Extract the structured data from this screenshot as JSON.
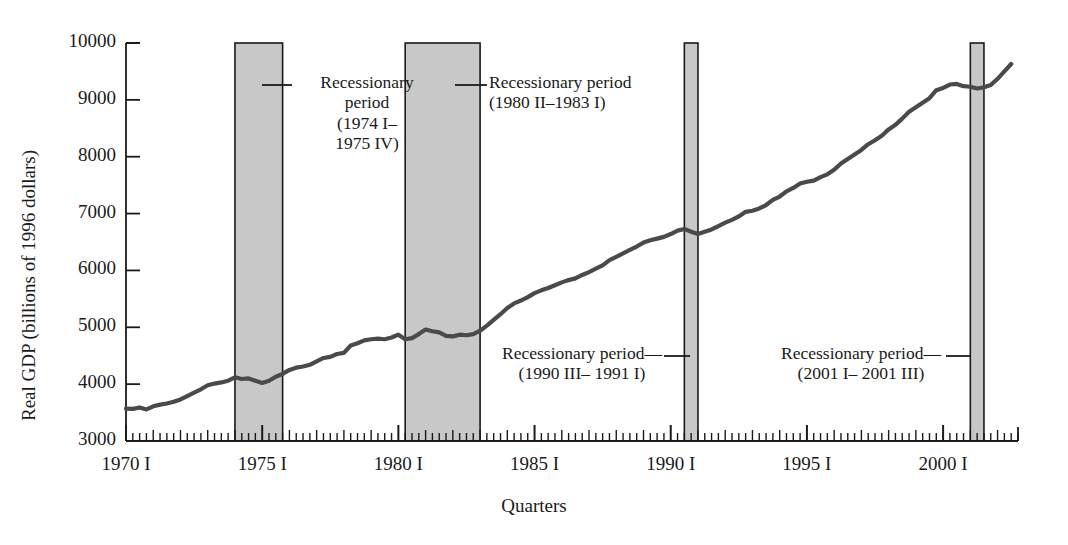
{
  "chart_data": {
    "type": "line",
    "title": "",
    "xlabel": "Quarters",
    "ylabel": "Real GDP (billions of 1996 dollars)",
    "ylim": [
      3000,
      10000
    ],
    "yticks": [
      3000,
      4000,
      5000,
      6000,
      7000,
      8000,
      9000,
      10000
    ],
    "ytick_labels": [
      "3000",
      "4000",
      "5000",
      "6000",
      "7000",
      "8000",
      "9000",
      "10000"
    ],
    "xlim": [
      1970.0,
      2002.75
    ],
    "xticks": [
      1970,
      1975,
      1980,
      1985,
      1990,
      1995,
      2000
    ],
    "xtick_labels": [
      "1970 I",
      "1975 I",
      "1980 I",
      "1985 I",
      "1990 I",
      "1995 I",
      "2000 I"
    ],
    "x_minor_tick_interval_years": 0.25,
    "grid": false,
    "legend": "none",
    "series": [
      {
        "name": "Real GDP",
        "color": "#4a4a4a",
        "x": [
          1970.0,
          1970.25,
          1970.5,
          1970.75,
          1971.0,
          1971.25,
          1971.5,
          1971.75,
          1972.0,
          1972.25,
          1972.5,
          1972.75,
          1973.0,
          1973.25,
          1973.5,
          1973.75,
          1974.0,
          1974.25,
          1974.5,
          1974.75,
          1975.0,
          1975.25,
          1975.5,
          1975.75,
          1976.0,
          1976.25,
          1976.5,
          1976.75,
          1977.0,
          1977.25,
          1977.5,
          1977.75,
          1978.0,
          1978.25,
          1978.5,
          1978.75,
          1979.0,
          1979.25,
          1979.5,
          1979.75,
          1980.0,
          1980.25,
          1980.5,
          1980.75,
          1981.0,
          1981.25,
          1981.5,
          1981.75,
          1982.0,
          1982.25,
          1982.5,
          1982.75,
          1983.0,
          1983.25,
          1983.5,
          1983.75,
          1984.0,
          1984.25,
          1984.5,
          1984.75,
          1985.0,
          1985.25,
          1985.5,
          1985.75,
          1986.0,
          1986.25,
          1986.5,
          1986.75,
          1987.0,
          1987.25,
          1987.5,
          1987.75,
          1988.0,
          1988.25,
          1988.5,
          1988.75,
          1989.0,
          1989.25,
          1989.5,
          1989.75,
          1990.0,
          1990.25,
          1990.5,
          1990.75,
          1991.0,
          1991.25,
          1991.5,
          1991.75,
          1992.0,
          1992.25,
          1992.5,
          1992.75,
          1993.0,
          1993.25,
          1993.5,
          1993.75,
          1994.0,
          1994.25,
          1994.5,
          1994.75,
          1995.0,
          1995.25,
          1995.5,
          1995.75,
          1996.0,
          1996.25,
          1996.5,
          1996.75,
          1997.0,
          1997.25,
          1997.5,
          1997.75,
          1998.0,
          1998.25,
          1998.5,
          1998.75,
          1999.0,
          1999.25,
          1999.5,
          1999.75,
          2000.0,
          2000.25,
          2000.5,
          2000.75,
          2001.0,
          2001.25,
          2001.5,
          2001.75,
          2002.0,
          2002.25,
          2002.5
        ],
        "y": [
          3570,
          3565,
          3590,
          3555,
          3610,
          3640,
          3660,
          3690,
          3730,
          3790,
          3850,
          3910,
          3980,
          4010,
          4030,
          4060,
          4120,
          4090,
          4100,
          4060,
          4020,
          4060,
          4130,
          4180,
          4250,
          4290,
          4310,
          4340,
          4400,
          4460,
          4480,
          4530,
          4550,
          4680,
          4720,
          4770,
          4790,
          4800,
          4790,
          4820,
          4870,
          4790,
          4810,
          4880,
          4960,
          4930,
          4910,
          4850,
          4840,
          4870,
          4860,
          4880,
          4940,
          5030,
          5130,
          5230,
          5340,
          5420,
          5470,
          5530,
          5600,
          5650,
          5690,
          5740,
          5790,
          5830,
          5860,
          5920,
          5970,
          6030,
          6090,
          6180,
          6240,
          6300,
          6360,
          6420,
          6490,
          6530,
          6560,
          6590,
          6640,
          6700,
          6730,
          6680,
          6640,
          6680,
          6720,
          6780,
          6840,
          6890,
          6950,
          7030,
          7050,
          7090,
          7150,
          7240,
          7300,
          7390,
          7450,
          7530,
          7560,
          7580,
          7640,
          7690,
          7770,
          7880,
          7960,
          8040,
          8120,
          8220,
          8290,
          8370,
          8480,
          8560,
          8670,
          8790,
          8870,
          8950,
          9030,
          9170,
          9210,
          9270,
          9280,
          9240,
          9230,
          9200,
          9220,
          9260,
          9370,
          9500,
          9630
        ]
      }
    ],
    "shaded_regions": [
      {
        "name": "recession-1974-1975",
        "label_lines": [
          "Recessionary",
          "period",
          "(1974 I–",
          "1975 IV)"
        ],
        "x_start": 1974.0,
        "x_end": 1975.75,
        "color": "#c8c8c8"
      },
      {
        "name": "recession-1980-1983",
        "label_lines": [
          "Recessionary period",
          "(1980 II–1983 I)"
        ],
        "x_start": 1980.25,
        "x_end": 1983.0,
        "color": "#c8c8c8"
      },
      {
        "name": "recession-1990-1991",
        "label_lines": [
          "Recessionary period—",
          "(1990 III– 1991 I)"
        ],
        "x_start": 1990.5,
        "x_end": 1991.0,
        "color": "#c8c8c8"
      },
      {
        "name": "recession-2001",
        "label_lines": [
          "Recessionary period—",
          "(2001 I– 2001 III)"
        ],
        "x_start": 2001.0,
        "x_end": 2001.5,
        "color": "#c8c8c8"
      }
    ],
    "annotations": [
      {
        "id": "ann-1974",
        "lines": [
          "Recessionary",
          "period",
          "(1974 I–",
          "1975 IV)"
        ],
        "align": "center",
        "leader": "left"
      },
      {
        "id": "ann-1980",
        "lines": [
          "Recessionary period",
          "(1980 II–1983 I)"
        ],
        "align": "left",
        "leader": "left"
      },
      {
        "id": "ann-1990",
        "lines": [
          "Recessionary period—",
          "(1990 III– 1991 I)"
        ],
        "align": "center",
        "leader": "right"
      },
      {
        "id": "ann-2001",
        "lines": [
          "Recessionary period—",
          "(2001 I– 2001 III)"
        ],
        "align": "center",
        "leader": "right"
      }
    ]
  },
  "axis_titles": {
    "y": "Real GDP (billions of 1996 dollars)",
    "x": "Quarters"
  },
  "y_tick_labels": [
    "10000",
    "9000",
    "8000",
    "7000",
    "6000",
    "5000",
    "4000",
    "3000"
  ],
  "x_tick_labels": [
    "1970 I",
    "1975 I",
    "1980 I",
    "1985 I",
    "1990 I",
    "1995 I",
    "2000 I"
  ],
  "annotation_text": {
    "a1_l1": "Recessionary",
    "a1_l2": "period",
    "a1_l3": "(1974 I–",
    "a1_l4": "1975 IV)",
    "a2_l1": "Recessionary period",
    "a2_l2": "(1980 II–1983 I)",
    "a3_l1": "Recessionary period—",
    "a3_l2": "(1990 III– 1991 I)",
    "a4_l1": "Recessionary period—",
    "a4_l2": "(2001 I– 2001 III)"
  },
  "colors": {
    "line": "#4a4a4a",
    "band": "#c8c8c8",
    "axis": "#1a1a1a",
    "text": "#1a1a1a",
    "background": "#ffffff"
  }
}
